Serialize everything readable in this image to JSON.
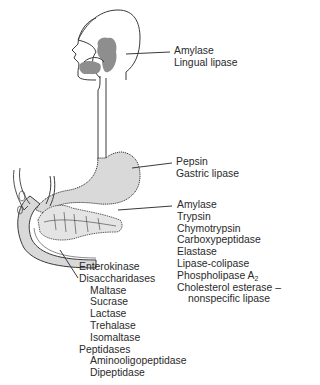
{
  "figure": {
    "colors": {
      "outline": "#3a3a3a",
      "gland_fill": "#8e8e8e",
      "organ_fill": "#d9d9d9",
      "text": "#2a2a2a"
    }
  },
  "labels": {
    "mouth": {
      "items": [
        "Amylase",
        "Lingual lipase"
      ]
    },
    "stomach": {
      "items": [
        "Pepsin",
        "Gastric lipase"
      ]
    },
    "pancreas": {
      "items": [
        "Amylase",
        "Trypsin",
        "Chymotrypsin",
        "Carboxypeptidase",
        "Elastase",
        "Lipase-colipase"
      ],
      "phospholipase": "Phospholipase A",
      "phospholipase_sub": "2",
      "cholesterol": "Cholesterol esterase –",
      "cholesterol_cont": "nonspecific lipase"
    },
    "small_intestine": {
      "enterokinase": "Enterokinase",
      "disaccharidases": "Disaccharidases",
      "disaccharidase_items": [
        "Maltase",
        "Sucrase",
        "Lactase",
        "Trehalase",
        "Isomaltase"
      ],
      "peptidases": "Peptidases",
      "peptidase_items": [
        "Aminooligopeptidase",
        "Dipeptidase"
      ]
    }
  }
}
